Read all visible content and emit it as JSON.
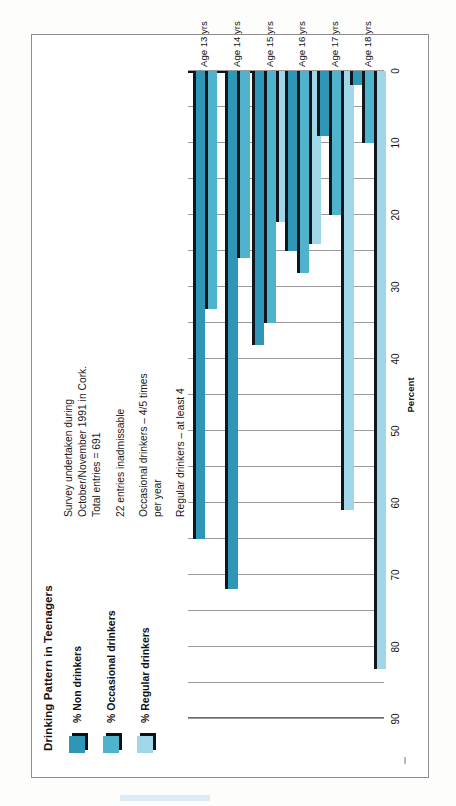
{
  "chart_data": {
    "type": "bar",
    "orientation": "horizontal",
    "title": "Drinking Pattern in Teenagers",
    "xlabel": "Percent",
    "ylabel": "",
    "xlim": [
      0,
      90
    ],
    "xticks": [
      0,
      10,
      20,
      30,
      40,
      50,
      60,
      70,
      80,
      90
    ],
    "gridlines_every": 5,
    "grid": true,
    "legend_position": "top-left",
    "categories": [
      "Age 13 yrs",
      "Age 14 yrs",
      "Age 15 yrs",
      "Age 16 yrs",
      "Age 17 yrs",
      "Age 18 yrs"
    ],
    "series": [
      {
        "name": "% Non drinkers",
        "color": "#2e97b8",
        "values": [
          65,
          72,
          38,
          25,
          9,
          2
        ]
      },
      {
        "name": "% Occasional drinkers",
        "color": "#4fb3ce",
        "values": [
          33,
          26,
          35,
          28,
          20,
          10
        ]
      },
      {
        "name": "% Regular drinkers",
        "color": "#9fd6e8",
        "values": [
          0,
          0,
          21,
          24,
          61,
          83
        ]
      }
    ],
    "notes": [
      [
        "Survey undertaken  during",
        "October/November 1991 in Cork.",
        "Total entries = 691"
      ],
      [
        "22 entries inadmissable"
      ],
      [
        "Occasional drinkers – 4/5 times",
        "per year"
      ],
      [
        "Regular drinkers – at least 4",
        "units of alcohol per 2 weeks"
      ]
    ]
  },
  "colors": {
    "non_drinkers": "#2e97b8",
    "occasional_drinkers": "#4fb3ce",
    "regular_drinkers": "#9fd6e8",
    "bar_cap": "#10161c",
    "gridline": "#9a9a9a",
    "axis": "#111111",
    "page_border": "#8d8d8d"
  }
}
